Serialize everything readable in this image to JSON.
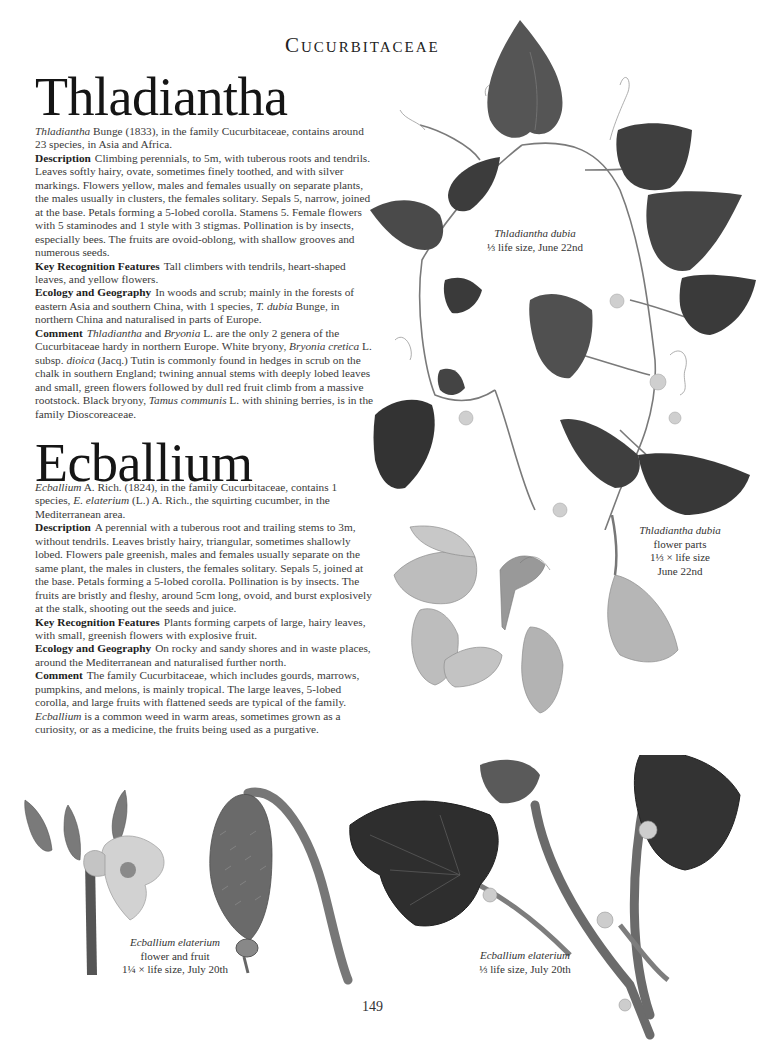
{
  "running_head": "Cucurbitaceae",
  "page_number": "149",
  "sections": [
    {
      "title": "Thladiantha",
      "intro": [
        {
          "italic": "Thladiantha"
        },
        {
          "text": " Bunge (1833), in the family Cucurbitaceae, contains around 23 species, in Asia and Africa."
        }
      ],
      "paragraphs": [
        {
          "label": "Description",
          "text": "Climbing perennials, to 5m, with tuberous roots and tendrils. Leaves softly hairy, ovate, sometimes finely toothed, and with silver markings. Flowers yellow, males and females usually on separate plants, the males usually in clusters, the females solitary. Sepals 5, narrow, joined at the base. Petals forming a 5-lobed corolla. Stamens 5. Female flowers with 5 staminodes and 1 style with 3 stigmas. Pollination is by insects, especially bees. The fruits are ovoid-oblong, with shallow grooves and numerous seeds."
        },
        {
          "label": "Key Recognition Features",
          "text": "Tall climbers with tendrils, heart-shaped leaves, and yellow flowers."
        },
        {
          "label": "Ecology and Geography",
          "text_parts": [
            {
              "text": "In woods and scrub; mainly in the forests of eastern Asia and southern China, with 1 species, "
            },
            {
              "italic": "T. dubia"
            },
            {
              "text": " Bunge, in northern China and naturalised in parts of Europe."
            }
          ]
        },
        {
          "label": "Comment",
          "text_parts": [
            {
              "italic": "Thladiantha"
            },
            {
              "text": " and "
            },
            {
              "italic": "Bryonia"
            },
            {
              "text": " L. are the only 2 genera of the Cucurbitaceae hardy in northern Europe. White bryony, "
            },
            {
              "italic": "Bryonia cretica"
            },
            {
              "text": " L. subsp. "
            },
            {
              "italic": "dioica"
            },
            {
              "text": " (Jacq.) Tutin is commonly found in hedges in scrub on the chalk in southern England; twining annual stems with deeply lobed leaves and small, green flowers followed by dull red fruit climb from a massive rootstock. Black bryony, "
            },
            {
              "italic": "Tamus communis"
            },
            {
              "text": " L. with shining berries, is in the family Dioscoreaceae."
            }
          ]
        }
      ]
    },
    {
      "title": "Ecballium",
      "intro": [
        {
          "italic": "Ecballium"
        },
        {
          "text": " A. Rich. (1824), in the family Cucurbitaceae, contains 1 species, "
        },
        {
          "italic": "E. elaterium"
        },
        {
          "text": " (L.) A. Rich., the squirting cucumber, in the Mediterranean area."
        }
      ],
      "paragraphs": [
        {
          "label": "Description",
          "text": "A perennial with a tuberous root and trailing stems to 3m, without tendrils. Leaves bristly hairy, triangular, sometimes shallowly lobed. Flowers pale greenish, males and females usually separate on the same plant, the males in clusters, the females solitary. Sepals 5, joined at the base. Petals forming a 5-lobed corolla. Pollination is by insects. The fruits are bristly and fleshy, around 5cm long, ovoid, and burst explosively at the stalk, shooting out the seeds and juice."
        },
        {
          "label": "Key Recognition Features",
          "text": "Plants forming carpets of large, hairy leaves, with small, greenish flowers with explosive fruit."
        },
        {
          "label": "Ecology and Geography",
          "text": "On rocky and sandy shores and in waste places, around the Mediterranean and naturalised further north."
        },
        {
          "label": "Comment",
          "text_parts": [
            {
              "text": "The family Cucurbitaceae, which includes gourds, marrows, pumpkins, and melons, is mainly tropical. The large leaves, 5-lobed corolla, and large fruits with flattened seeds are typical of the family. "
            },
            {
              "italic": "Ecballium"
            },
            {
              "text": " is a common weed in warm areas, sometimes grown as a curiosity, or as a medicine, the fruits being used as a purgative."
            }
          ]
        }
      ]
    }
  ],
  "captions": {
    "thladiantha_plant": {
      "species": "Thladiantha dubia",
      "lines": [
        "⅓ life size, June 22nd"
      ]
    },
    "thladiantha_flowers": {
      "species": "Thladiantha dubia",
      "lines": [
        "flower parts",
        "1⅓ × life size",
        "June 22nd"
      ]
    },
    "ecballium_flower_fruit": {
      "species": "Ecballium elaterium",
      "lines": [
        "flower and fruit",
        "1¼ × life size, July 20th"
      ]
    },
    "ecballium_plant": {
      "species": "Ecballium elaterium",
      "lines": [
        "⅓ life size, July 20th"
      ]
    }
  },
  "colors": {
    "leaf_dark": "#3d3d3d",
    "leaf_mid": "#5a5a5a",
    "petal": "#b9b9b9",
    "stem": "#6e6e6e",
    "text": "#3a3a3a"
  }
}
